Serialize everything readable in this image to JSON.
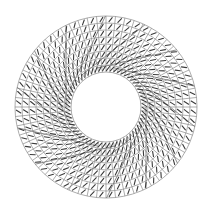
{
  "diagram": {
    "type": "annular-polar-mesh",
    "canvas": {
      "width": 211,
      "height": 215,
      "background": "#ffffff"
    },
    "center": {
      "x": 106,
      "y": 107
    },
    "inner_radius": 35,
    "outer_radius": 91,
    "rings": 8,
    "spokes": 60,
    "tick": {
      "length": 5.2,
      "angle_offset_deg": 35,
      "color": "#3a3a3a"
    },
    "chords": {
      "count": 14,
      "tangent_radius": 40,
      "color": "#707070"
    },
    "colors": {
      "grid": "#8a8a8a",
      "tick": "#3a3a3a",
      "chord": "#707070"
    }
  }
}
